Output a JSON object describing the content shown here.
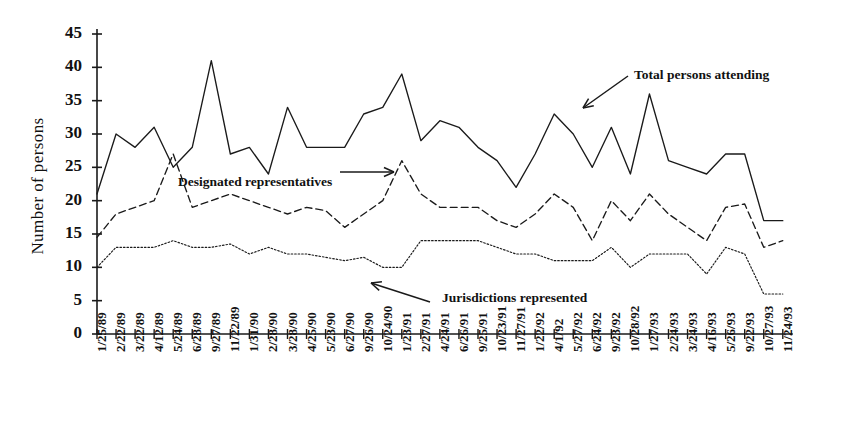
{
  "chart_data": {
    "type": "line",
    "title": "",
    "xlabel": "",
    "ylabel": "Number of persons",
    "ylim": [
      0,
      45
    ],
    "yticks": [
      0,
      5,
      10,
      15,
      20,
      25,
      30,
      35,
      40,
      45
    ],
    "grid": false,
    "legend_position": "inline-annotations",
    "categories": [
      "1/25/89",
      "2/22/89",
      "3/22/89",
      "4/12/89",
      "5/24/89",
      "6/28/89",
      "9/27/89",
      "11/22/89",
      "1/31/90",
      "2/28/90",
      "3/28/90",
      "4/25/90",
      "5/23/90",
      "6/27/90",
      "9/26/90",
      "10/24/90",
      "1/23/91",
      "2/27/91",
      "4/24/91",
      "6/26/91",
      "9/25/91",
      "10/23/91",
      "11/27/91",
      "1/22/92",
      "4/1/92",
      "5/27/92",
      "6/24/92",
      "9/23/92",
      "10/28/92",
      "1/27/93",
      "2/24/93",
      "3/24/93",
      "4/16/93",
      "5/26/93",
      "9/22/93",
      "10/27/93",
      "11/24/93"
    ],
    "series": [
      {
        "name": "Total persons attending",
        "style": "solid",
        "color": "#1a1a1a",
        "values": [
          21,
          30,
          28,
          31,
          25,
          28,
          41,
          27,
          28,
          24,
          34,
          28,
          28,
          28,
          33,
          34,
          39,
          29,
          32,
          31,
          28,
          26,
          22,
          27,
          33,
          30,
          25,
          31,
          24,
          36,
          26,
          25,
          24,
          27,
          27,
          17,
          17
        ]
      },
      {
        "name": "Designated representatives",
        "style": "dashed",
        "color": "#1a1a1a",
        "values": [
          14.5,
          18,
          19,
          20,
          27,
          19,
          20,
          21,
          20,
          19,
          18,
          19,
          18.5,
          16,
          18,
          20,
          26,
          21,
          19,
          19,
          19,
          17,
          16,
          18,
          21,
          19,
          14,
          20,
          17,
          21,
          18,
          16,
          14,
          19,
          19.5,
          13,
          14
        ]
      },
      {
        "name": "Jurisdictions represented",
        "style": "dotted",
        "color": "#1a1a1a",
        "values": [
          10,
          13,
          13,
          13,
          14,
          13,
          13,
          13.5,
          12,
          13,
          12,
          12,
          11.5,
          11,
          11.5,
          10,
          10,
          14,
          14,
          14,
          14,
          13,
          12,
          12,
          11,
          11,
          11,
          13,
          10,
          12,
          12,
          12,
          9,
          13,
          12,
          6,
          6
        ]
      }
    ],
    "annotations": [
      {
        "id": "total-persons-attending",
        "text": "Total persons attending",
        "text_x": 634,
        "text_y": 67,
        "arrow": "down-left",
        "arrow_x1": 628,
        "arrow_y1": 76,
        "arrow_x2": 583,
        "arrow_y2": 108
      },
      {
        "id": "designated-representatives",
        "text": "Designated representatives",
        "text_x": 178,
        "text_y": 174,
        "arrow": "right",
        "arrow_x1": 340,
        "arrow_y1": 172,
        "arrow_x2": 394,
        "arrow_y2": 172
      },
      {
        "id": "jurisdictions-represented",
        "text": "Jurisdictions represented",
        "text_x": 442,
        "text_y": 290,
        "arrow": "left",
        "arrow_x1": 430,
        "arrow_y1": 302,
        "arrow_x2": 371,
        "arrow_y2": 283
      }
    ]
  },
  "axes": {
    "y_tick_labels": [
      "45",
      "40",
      "35",
      "30",
      "25",
      "20",
      "15",
      "10",
      "5",
      "0"
    ],
    "y_axis_title": "Number of persons"
  }
}
